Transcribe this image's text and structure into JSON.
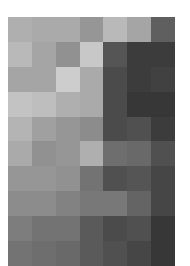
{
  "chart_data": {
    "type": "heatmap",
    "title": "",
    "xlabel": "",
    "ylabel": "",
    "colormap": "grayscale (0=black, 255=white)",
    "rows": 10,
    "cols": 7,
    "values": [
      [
        175,
        170,
        170,
        150,
        185,
        165,
        95
      ],
      [
        185,
        165,
        145,
        200,
        85,
        60,
        60
      ],
      [
        165,
        165,
        205,
        170,
        75,
        60,
        65
      ],
      [
        195,
        190,
        175,
        170,
        75,
        55,
        55
      ],
      [
        180,
        160,
        150,
        140,
        75,
        80,
        60
      ],
      [
        170,
        145,
        150,
        175,
        110,
        105,
        80
      ],
      [
        150,
        150,
        145,
        115,
        80,
        85,
        70
      ],
      [
        140,
        140,
        130,
        120,
        120,
        100,
        70
      ],
      [
        125,
        115,
        115,
        90,
        75,
        80,
        55
      ],
      [
        115,
        110,
        105,
        90,
        80,
        70,
        55
      ]
    ]
  }
}
